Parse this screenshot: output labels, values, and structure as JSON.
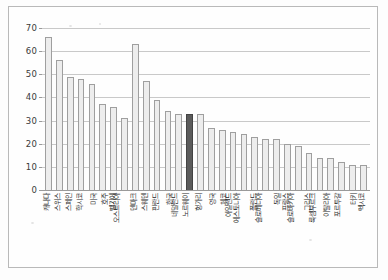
{
  "figure": {
    "background_color": "#fdfdfd",
    "frame_color": "#b9b9b9",
    "bar_fill": "#ededed",
    "bar_stroke": "#9f9f9f",
    "highlight_fill": "#5b5b5b",
    "highlight_stroke": "#434343",
    "gridline_color": "#c9c9c9"
  },
  "chart_data": {
    "type": "bar",
    "title": "",
    "subtitle": "",
    "xlabel": "",
    "ylabel": "",
    "ylim": [
      0,
      70
    ],
    "ytick_values": [
      0,
      10,
      20,
      30,
      40,
      50,
      60,
      70
    ],
    "ytick_labels": [
      "0",
      "10",
      "20",
      "30",
      "40",
      "50",
      "60",
      "70"
    ],
    "grid": true,
    "legend": false,
    "legend_position": "none",
    "highlight_category": "한국",
    "highlight_index": 13,
    "categories": [
      "캐나다",
      "스위스",
      "스페인",
      "학시코",
      "미국",
      "호주",
      "벨기에",
      "오스트리아",
      "덴마크",
      "스웨덴",
      "핀란드",
      "한국",
      "네덜란드",
      "노르웨이",
      "헝가리",
      "영국",
      "체코",
      "아일랜드",
      "에스토니아",
      "폴란드",
      "슬로베니아",
      "독일",
      "프랑스",
      "슬로바키아",
      "그리스",
      "룩셈부르크",
      "이탈리아",
      "포르투갈",
      "터키",
      "멕시코"
    ],
    "values": [
      66,
      56,
      49,
      48,
      46,
      37,
      36,
      31,
      63,
      47,
      39,
      34,
      33,
      33,
      33,
      27,
      26,
      25,
      24,
      23,
      22,
      22,
      20,
      19,
      16,
      14,
      14,
      12,
      11,
      11
    ],
    "value_note_unit": "%"
  }
}
